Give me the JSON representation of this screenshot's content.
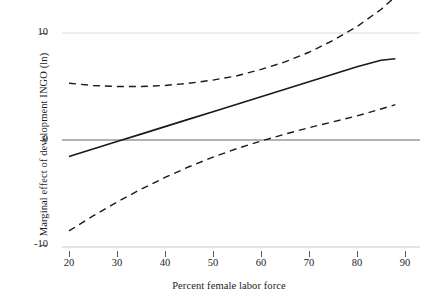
{
  "chart_data": {
    "type": "line",
    "title": "",
    "xlabel": "Percent female labor force",
    "ylabel": "Marginal effect of development INGO (ln)",
    "xlim": [
      17,
      92
    ],
    "ylim": [
      -10.5,
      14.5
    ],
    "xticks": [
      20,
      30,
      40,
      50,
      60,
      70,
      80,
      90
    ],
    "xtick_labels": [
      "20",
      "30",
      "40",
      "50",
      "60",
      "70",
      "80",
      "90"
    ],
    "yticks": [
      -10,
      0,
      10
    ],
    "ytick_labels": [
      "-10",
      "0",
      "10"
    ],
    "grid": "horizontal-reference-lines",
    "legend": "none",
    "reference_line_y": 0,
    "x": [
      20,
      25,
      30,
      35,
      40,
      45,
      50,
      55,
      60,
      65,
      70,
      75,
      80,
      85,
      88
    ],
    "series": [
      {
        "name": "Marginal effect",
        "style": "solid",
        "color": "#1a1a1a",
        "values": [
          -1.55,
          -0.85,
          -0.15,
          0.55,
          1.25,
          1.95,
          2.65,
          3.35,
          4.05,
          4.75,
          5.45,
          6.15,
          6.85,
          7.45,
          7.6
        ]
      },
      {
        "name": "Upper 95% confidence bound",
        "style": "dashed",
        "color": "#1a1a1a",
        "values": [
          5.3,
          5.1,
          5.0,
          5.0,
          5.1,
          5.3,
          5.6,
          6.0,
          6.6,
          7.3,
          8.2,
          9.3,
          10.6,
          12.2,
          13.4
        ]
      },
      {
        "name": "Lower 95% confidence bound",
        "style": "dashed",
        "color": "#1a1a1a",
        "values": [
          -8.5,
          -7.1,
          -5.8,
          -4.6,
          -3.5,
          -2.5,
          -1.6,
          -0.8,
          -0.1,
          0.55,
          1.15,
          1.7,
          2.25,
          2.9,
          3.3
        ]
      }
    ]
  },
  "axes": {
    "y_title": "Marginal effect of development INGO (ln)",
    "x_title": "Percent female labor force",
    "y_labels": [
      "10",
      "0",
      "-10"
    ],
    "x_labels": [
      "20",
      "30",
      "40",
      "50",
      "60",
      "70",
      "80",
      "90"
    ]
  },
  "colors": {
    "line": "#1a1a1a",
    "axis": "#bdbdbd",
    "zero_line": "#9a9a9a",
    "text": "#1c1c1c"
  }
}
